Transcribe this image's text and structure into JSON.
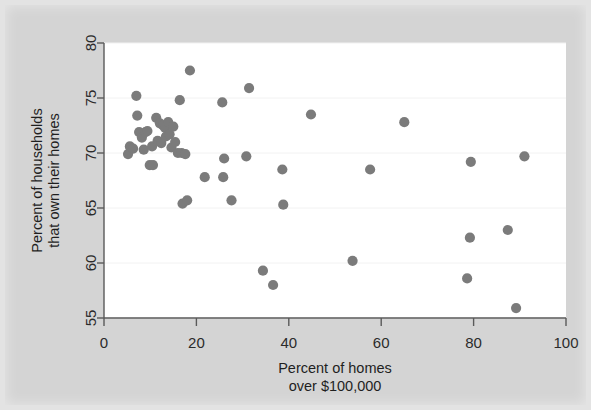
{
  "figure": {
    "background_color": "#d4d4d4",
    "plot_background_color": "#ffffff",
    "point_color": "#7b7b7b",
    "axis_color": "#5a5a5a",
    "grid_color": "#f2f2f2"
  },
  "chart_data": {
    "type": "scatter",
    "title": "",
    "subtitle": "",
    "xlabel": "Percent of homes over $100,000",
    "xlabel_line1": "Percent of homes",
    "xlabel_line2": "over $100,000",
    "ylabel": "Percent of households that own their homes",
    "ylabel_line1": "Percent of households",
    "ylabel_line2": "that own their homes",
    "xlim": [
      0,
      100
    ],
    "ylim": [
      55,
      80
    ],
    "xticks": [
      0,
      20,
      40,
      60,
      80,
      100
    ],
    "yticks": [
      55,
      60,
      65,
      70,
      75,
      80
    ],
    "xtick_labels": [
      "0",
      "20",
      "40",
      "60",
      "80",
      "100"
    ],
    "ytick_labels": [
      "55",
      "60",
      "65",
      "70",
      "75",
      "80"
    ],
    "grid": "horizontal-faint",
    "legend": null,
    "legend_position": "none",
    "series": [
      {
        "name": "states",
        "marker": "circle",
        "color": "#7b7b7b",
        "points": [
          [
            5.2,
            69.9
          ],
          [
            5.6,
            70.6
          ],
          [
            6.3,
            70.4
          ],
          [
            7.0,
            75.2
          ],
          [
            7.2,
            73.4
          ],
          [
            7.6,
            71.9
          ],
          [
            8.2,
            71.4
          ],
          [
            8.6,
            70.3
          ],
          [
            9.0,
            71.9
          ],
          [
            9.4,
            72.0
          ],
          [
            9.9,
            68.9
          ],
          [
            10.4,
            70.6
          ],
          [
            10.6,
            68.9
          ],
          [
            11.3,
            73.2
          ],
          [
            11.6,
            71.1
          ],
          [
            12.1,
            72.7
          ],
          [
            12.4,
            70.9
          ],
          [
            12.8,
            72.5
          ],
          [
            13.2,
            72.3
          ],
          [
            13.4,
            71.5
          ],
          [
            13.9,
            72.8
          ],
          [
            14.2,
            71.7
          ],
          [
            14.6,
            70.5
          ],
          [
            15.0,
            72.4
          ],
          [
            15.4,
            71.0
          ],
          [
            16.0,
            70.0
          ],
          [
            16.4,
            74.8
          ],
          [
            16.8,
            70.0
          ],
          [
            17.0,
            65.4
          ],
          [
            17.6,
            69.9
          ],
          [
            18.0,
            65.7
          ],
          [
            18.6,
            77.5
          ],
          [
            21.8,
            67.8
          ],
          [
            25.6,
            74.6
          ],
          [
            25.8,
            67.8
          ],
          [
            26.0,
            69.5
          ],
          [
            27.6,
            65.7
          ],
          [
            30.8,
            69.7
          ],
          [
            31.4,
            75.9
          ],
          [
            34.4,
            59.3
          ],
          [
            36.6,
            58.0
          ],
          [
            38.6,
            68.5
          ],
          [
            38.8,
            65.3
          ],
          [
            44.8,
            73.5
          ],
          [
            53.8,
            60.2
          ],
          [
            57.6,
            68.5
          ],
          [
            65.0,
            72.8
          ],
          [
            78.6,
            58.6
          ],
          [
            79.2,
            62.3
          ],
          [
            79.4,
            69.2
          ],
          [
            87.4,
            63.0
          ],
          [
            89.2,
            55.9
          ],
          [
            91.0,
            69.7
          ]
        ]
      }
    ]
  }
}
